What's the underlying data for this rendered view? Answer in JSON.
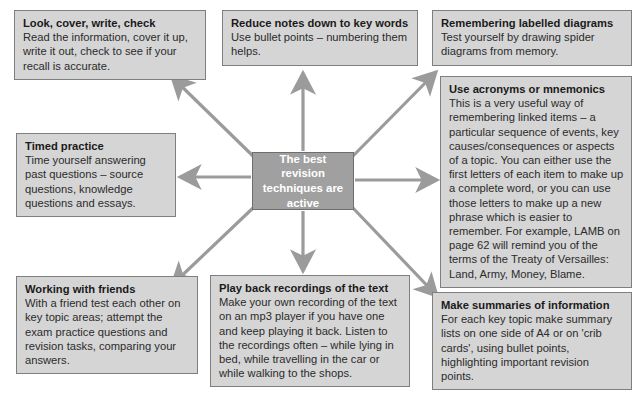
{
  "diagram": {
    "type": "spider-diagram",
    "center": {
      "id": "center",
      "text": "The best revision techniques are active",
      "fill": "#a0a0a0",
      "text_color": "#ffffff"
    },
    "node_fill": "#d5d5d5",
    "node_border": "#7f7f7f",
    "arrow_color": "#9b9b9b",
    "nodes": [
      {
        "id": "look",
        "title": "Look, cover, write, check",
        "body": "Read the information, cover it up, write it out, check to see if your recall is accurate."
      },
      {
        "id": "reduce",
        "title": "Reduce notes down to key words",
        "body": "Use bullet points – numbering them helps."
      },
      {
        "id": "diagrams",
        "title": "Remembering labelled diagrams",
        "body": "Test yourself by drawing spider diagrams from memory."
      },
      {
        "id": "acronyms",
        "title": "Use acronyms or mnemonics",
        "body": "This is a very useful way of remembering linked items – a particular sequence of events, key causes/consequences or aspects of a topic. You can either use the first letters of each item to make up a complete word, or you can use those letters to make up a new phrase which is easier to remember. For example, LAMB on page 62 will remind you of the terms of the Treaty of Versailles: Land, Army, Money, Blame."
      },
      {
        "id": "timed",
        "title": "Timed practice",
        "body": "Time yourself answering past questions – source questions, knowledge questions and essays."
      },
      {
        "id": "friends",
        "title": "Working with friends",
        "body": "With a friend test each other on key topic areas; attempt the exam practice questions and revision tasks, comparing your answers."
      },
      {
        "id": "playback",
        "title": "Play back recordings of the text",
        "body": "Make your own recording of the text on an mp3 player if you have one and keep playing it back. Listen to the recordings often – while lying in bed, while travelling in the car or while walking to the shops."
      },
      {
        "id": "summaries",
        "title": "Make summaries of information",
        "body": "For each key topic make summary lists on one side of A4 or on 'crib cards', using bullet points, highlighting important revision points."
      }
    ],
    "connectors": [
      {
        "id": "to-look",
        "from": "center",
        "to": "look",
        "direction": "up-left"
      },
      {
        "id": "to-reduce",
        "from": "center",
        "to": "reduce",
        "direction": "up"
      },
      {
        "id": "to-diagrams",
        "from": "center",
        "to": "diagrams",
        "direction": "up-right"
      },
      {
        "id": "to-acronyms",
        "from": "center",
        "to": "acronyms",
        "direction": "right"
      },
      {
        "id": "to-timed",
        "from": "center",
        "to": "timed",
        "direction": "left"
      },
      {
        "id": "to-friends",
        "from": "center",
        "to": "friends",
        "direction": "down-left"
      },
      {
        "id": "to-playback",
        "from": "center",
        "to": "playback",
        "direction": "down"
      },
      {
        "id": "to-summaries",
        "from": "center",
        "to": "summaries",
        "direction": "down-right"
      }
    ]
  }
}
